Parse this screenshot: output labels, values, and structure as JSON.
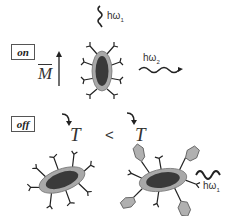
{
  "diagram": {
    "on_state": {
      "label": "on",
      "field_symbol": "M",
      "absorbed_photon": {
        "symbol": "hω",
        "subscript": "1"
      },
      "emitted_photon": {
        "symbol": "hω",
        "subscript": "2"
      },
      "particle": "nanoparticle-with-ligands-vertical"
    },
    "off_state": {
      "label": "off",
      "temperature_left": "T",
      "comparison": "<",
      "temperature_right": "T",
      "left_particle": "nanoparticle-with-ligands",
      "right_particle": "nanoparticle-with-ligands-and-bound-molecules",
      "emitted_photon": {
        "symbol": "hω",
        "subscript": "1"
      }
    },
    "colors": {
      "core": "#3a3a3a",
      "shell": "#a8a8a8",
      "ligand": "#222222",
      "bound_molecule": "#b0b0b0",
      "line": "#222222"
    }
  }
}
